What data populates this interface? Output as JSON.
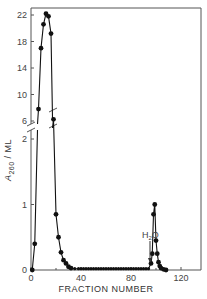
{
  "chart_data": {
    "type": "line",
    "title": "",
    "xlabel": "FRACTION NUMBER",
    "ylabel": "A260 / ML",
    "ylabel_main": "A",
    "ylabel_sub": "260",
    "ylabel_rest": " / ML",
    "xlim": [
      0,
      125
    ],
    "x_ticks": [
      0,
      40,
      80,
      120
    ],
    "x_tick_labels": [
      "0",
      "40",
      "80",
      "120"
    ],
    "broken_y_axis": true,
    "y_upper_ticks": [
      6,
      10,
      14,
      18,
      22
    ],
    "y_upper_tick_labels": [
      "6",
      "10",
      "14",
      "18",
      "22"
    ],
    "y_lower_ticks": [
      0,
      1,
      2
    ],
    "y_lower_tick_labels": [
      "0",
      "1",
      "2"
    ],
    "grid": false,
    "annotation": {
      "text": "H2O",
      "x": 95,
      "arrow_to_y": 0.1
    },
    "series": [
      {
        "name": "A260",
        "x": [
          1,
          3,
          6,
          8,
          10,
          12,
          14,
          16,
          18,
          20,
          22,
          24,
          26,
          28,
          30,
          32,
          35,
          38,
          40,
          42,
          44,
          46,
          48,
          50,
          52,
          54,
          56,
          58,
          60,
          62,
          64,
          66,
          68,
          70,
          72,
          74,
          76,
          78,
          80,
          82,
          84,
          86,
          88,
          90,
          92,
          94,
          96,
          97,
          98,
          99,
          100,
          101,
          102,
          103,
          104,
          106,
          108
        ],
        "values": [
          0,
          0.4,
          7.8,
          17.0,
          20.6,
          22.2,
          21.8,
          19.2,
          2.3,
          0.85,
          0.5,
          0.27,
          0.15,
          0.1,
          0.05,
          0.03,
          0.02,
          0.02,
          0.02,
          0.02,
          0.02,
          0.02,
          0.02,
          0.02,
          0.02,
          0.02,
          0.02,
          0.02,
          0.02,
          0.02,
          0.02,
          0.02,
          0.02,
          0.02,
          0.02,
          0.02,
          0.02,
          0.02,
          0.02,
          0.02,
          0.02,
          0.02,
          0.02,
          0.02,
          0.02,
          0.02,
          0.1,
          0.25,
          0.85,
          1.0,
          0.45,
          0.25,
          0.12,
          0.06,
          0.03,
          0.01,
          0.0
        ]
      }
    ]
  }
}
